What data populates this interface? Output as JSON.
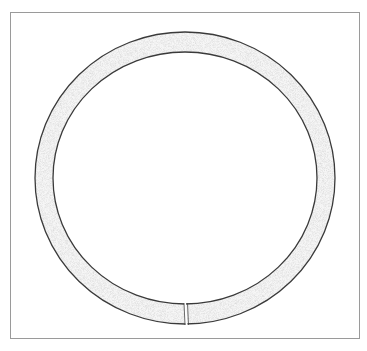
{
  "figure": {
    "frame_color": "#9a9a9a",
    "ring": {
      "cx": 185,
      "cy": 178,
      "rx": 141,
      "ry": 137,
      "thickness": 19,
      "outline_color": "#3a3a3a",
      "fill_color": "#f4f4f4",
      "gap_x": 186
    }
  }
}
